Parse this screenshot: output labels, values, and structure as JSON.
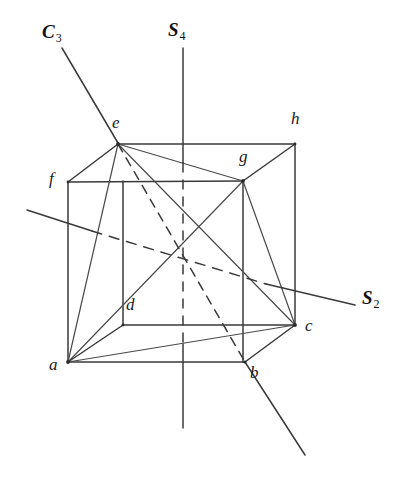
{
  "figure": {
    "background_color": "#ffffff",
    "line_color": "#3a3a3a",
    "label_color": "#1a1a1a",
    "width": 407,
    "height": 483
  },
  "vertices": [
    {
      "id": "a",
      "label": "a",
      "x": 68,
      "y": 362,
      "label_x": 49,
      "label_y": 364
    },
    {
      "id": "b",
      "label": "b",
      "x": 245,
      "y": 362,
      "label_x": 250,
      "label_y": 368
    },
    {
      "id": "c",
      "label": "c",
      "x": 295,
      "y": 325,
      "label_x": 305,
      "label_y": 324
    },
    {
      "id": "d",
      "label": "d",
      "x": 123,
      "y": 325,
      "label_x": 126,
      "label_y": 303
    },
    {
      "id": "e",
      "label": "e",
      "x": 118,
      "y": 144,
      "label_x": 113,
      "label_y": 120
    },
    {
      "id": "f",
      "label": "f",
      "x": 68,
      "y": 182,
      "label_x": 50,
      "label_y": 178
    },
    {
      "id": "g",
      "label": "g",
      "x": 243,
      "y": 181,
      "label_x": 240,
      "label_y": 155
    },
    {
      "id": "h",
      "label": "h",
      "x": 295,
      "y": 144,
      "label_x": 292,
      "label_y": 118
    }
  ],
  "axes": [
    {
      "id": "C3",
      "label": "C",
      "subscript": "3",
      "label_x": 42,
      "label_y": 25,
      "description": "three-fold rotation axis through body diagonal e-b"
    },
    {
      "id": "S4",
      "label": "S",
      "subscript": "4",
      "label_x": 170,
      "label_y": 22,
      "description": "four-fold improper rotation axis, vertical through face centres"
    },
    {
      "id": "S2",
      "label": "S",
      "subscript": "2",
      "label_x": 362,
      "label_y": 294,
      "description": "two-fold improper rotation axis through opposite edge midpoints"
    }
  ],
  "cube_edges_visible": [
    [
      "e",
      "f"
    ],
    [
      "e",
      "h"
    ],
    [
      "f",
      "g"
    ],
    [
      "g",
      "h"
    ],
    [
      "a",
      "d"
    ],
    [
      "d",
      "c"
    ],
    [
      "a",
      "b"
    ],
    [
      "b",
      "c"
    ],
    [
      "a",
      "f"
    ],
    [
      "c",
      "h"
    ],
    [
      "d",
      "g"
    ]
  ],
  "cube_edges_hidden": [
    [
      "b",
      "e"
    ]
  ],
  "tetrahedron_edges": [
    [
      "a",
      "e"
    ],
    [
      "a",
      "c"
    ],
    [
      "a",
      "g"
    ],
    [
      "e",
      "c"
    ],
    [
      "e",
      "g"
    ],
    [
      "c",
      "g"
    ]
  ],
  "axis_segments": {
    "C3": {
      "solid_outer_top": [
        [
          62,
          48
        ],
        [
          118,
          143
        ]
      ],
      "solid_outer_bottom": [
        [
          245,
          362
        ],
        [
          305,
          455
        ]
      ],
      "hidden_inner": [
        [
          118,
          144
        ],
        [
          245,
          362
        ]
      ]
    },
    "S4": {
      "solid_top": [
        [
          183,
          48
        ],
        [
          183,
          184
        ]
      ],
      "hidden_inner": [
        [
          183,
          184
        ],
        [
          183,
          362
        ]
      ],
      "solid_bottom": [
        [
          183,
          362
        ],
        [
          183,
          428
        ]
      ]
    },
    "S2": {
      "solid_left": [
        [
          27,
          210
        ],
        [
          95,
          232
        ]
      ],
      "hidden_inner": [
        [
          95,
          232
        ],
        [
          268,
          285
        ]
      ],
      "solid_right": [
        [
          268,
          285
        ],
        [
          355,
          305
        ]
      ]
    }
  }
}
